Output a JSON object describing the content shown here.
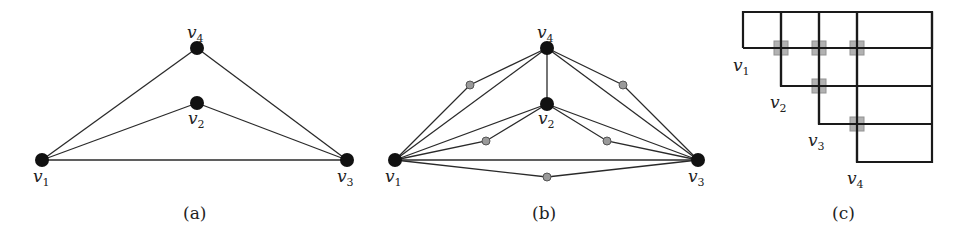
{
  "figure": {
    "panels": [
      {
        "id": "a",
        "caption": "(a)",
        "vertices": [
          {
            "name": "v1",
            "label": "v",
            "sub": "1"
          },
          {
            "name": "v2",
            "label": "v",
            "sub": "2"
          },
          {
            "name": "v3",
            "label": "v",
            "sub": "3"
          },
          {
            "name": "v4",
            "label": "v",
            "sub": "4"
          }
        ],
        "edges": [
          [
            "v1",
            "v4"
          ],
          [
            "v4",
            "v3"
          ],
          [
            "v1",
            "v2"
          ],
          [
            "v2",
            "v3"
          ],
          [
            "v1",
            "v3"
          ]
        ]
      },
      {
        "id": "b",
        "caption": "(b)",
        "vertices": [
          {
            "name": "v1",
            "label": "v",
            "sub": "1"
          },
          {
            "name": "v2",
            "label": "v",
            "sub": "2"
          },
          {
            "name": "v3",
            "label": "v",
            "sub": "3"
          },
          {
            "name": "v4",
            "label": "v",
            "sub": "4"
          }
        ],
        "edges": [
          [
            "v1",
            "v4"
          ],
          [
            "v4",
            "v3"
          ],
          [
            "v4",
            "v2"
          ],
          [
            "v1",
            "v2"
          ],
          [
            "v2",
            "v3"
          ],
          [
            "v1",
            "v3"
          ]
        ],
        "subdivided_edges": [
          [
            "v1",
            "v4"
          ],
          [
            "v4",
            "v3"
          ],
          [
            "v1",
            "v2"
          ],
          [
            "v2",
            "v3"
          ],
          [
            "v1",
            "v3"
          ]
        ]
      },
      {
        "id": "c",
        "caption": "(c)",
        "labels": [
          {
            "name": "v1",
            "label": "v",
            "sub": "1"
          },
          {
            "name": "v2",
            "label": "v",
            "sub": "2"
          },
          {
            "name": "v3",
            "label": "v",
            "sub": "3"
          },
          {
            "name": "v4",
            "label": "v",
            "sub": "4"
          }
        ],
        "crossings": 5
      }
    ]
  }
}
